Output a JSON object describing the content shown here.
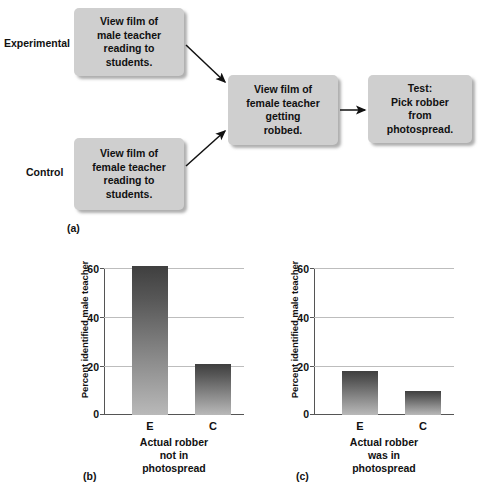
{
  "figure": {
    "panel_a": {
      "caption": "(a)",
      "group_labels": [
        {
          "name": "experimental",
          "text": "Experimental"
        },
        {
          "name": "control",
          "text": "Control"
        }
      ],
      "boxes": [
        {
          "id": "experimental-condition",
          "text": "View film of\nmale teacher\nreading to\nstudents."
        },
        {
          "id": "control-condition",
          "text": "View film of\nfemale teacher\nreading to\nstudents."
        },
        {
          "id": "robbery-film",
          "text": "View film of\nfemale teacher\ngetting\nrobbed."
        },
        {
          "id": "test",
          "text": "Test:\nPick robber\nfrom\nphotospread."
        }
      ]
    },
    "panel_b": {
      "caption": "(b)"
    },
    "panel_c": {
      "caption": "(c)"
    }
  },
  "colors": {
    "box_fill": "#cfcfcf",
    "bar_top": "#3f3f3f",
    "bar_bottom": "#b9b9b9",
    "gridline": "#bdbdbd",
    "axis": "#555555",
    "text": "#111111",
    "background": "#ffffff"
  },
  "chart_data": [
    {
      "type": "bar",
      "panel": "b",
      "title": "",
      "categories": [
        "E",
        "C"
      ],
      "values": [
        61,
        21
      ],
      "xlabel": "Actual robber\nnot in\nphotospread",
      "ylabel": "Percent identified male teacher",
      "ylim": [
        0,
        60
      ],
      "yticks": [
        0,
        20,
        40,
        60
      ],
      "grid": true,
      "legend": false
    },
    {
      "type": "bar",
      "panel": "c",
      "title": "",
      "categories": [
        "E",
        "C"
      ],
      "values": [
        18,
        10
      ],
      "xlabel": "Actual robber\nwas in\nphotospread",
      "ylabel": "Percent identified male teacher",
      "ylim": [
        0,
        60
      ],
      "yticks": [
        0,
        20,
        40,
        60
      ],
      "grid": true,
      "legend": false
    }
  ]
}
